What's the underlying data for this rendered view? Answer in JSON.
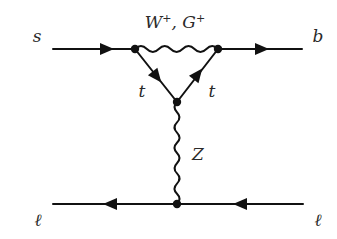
{
  "diagram": {
    "type": "feynman",
    "colors": {
      "line": "#111111",
      "text": "#2a2a2a",
      "background": "#ffffff"
    },
    "labels": {
      "s": "s",
      "b": "b",
      "boson_top_main1": "W",
      "boson_top_sup1": "+",
      "boson_top_sep": ", ",
      "boson_top_main2": "G",
      "boson_top_sup2": "+",
      "t_left": "t",
      "t_right": "t",
      "Z": "Z",
      "lepton_left": "ℓ",
      "lepton_right": "ℓ"
    },
    "vertices": [
      {
        "id": "v_left",
        "x": 135,
        "y": 49
      },
      {
        "id": "v_right",
        "x": 218,
        "y": 49
      },
      {
        "id": "v_bottom_loop",
        "x": 177,
        "y": 102
      },
      {
        "id": "v_lepton",
        "x": 177,
        "y": 204
      }
    ],
    "propagators": [
      {
        "from": "s",
        "to": "v_left",
        "kind": "fermion",
        "arrow": "right"
      },
      {
        "from": "v_right",
        "to": "b",
        "kind": "fermion",
        "arrow": "right"
      },
      {
        "from": "v_left",
        "to": "v_right",
        "kind": "boson",
        "label": "W+, G+"
      },
      {
        "from": "v_left",
        "to": "v_bottom_loop",
        "kind": "fermion",
        "label": "t"
      },
      {
        "from": "v_bottom_loop",
        "to": "v_right",
        "kind": "fermion",
        "label": "t"
      },
      {
        "from": "v_bottom_loop",
        "to": "v_lepton",
        "kind": "boson",
        "label": "Z"
      },
      {
        "from": "lepton_right",
        "to": "v_lepton",
        "kind": "fermion",
        "arrow": "left"
      },
      {
        "from": "v_lepton",
        "to": "lepton_left",
        "kind": "fermion",
        "arrow": "left"
      }
    ]
  }
}
